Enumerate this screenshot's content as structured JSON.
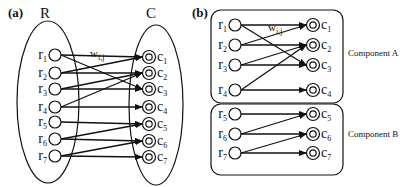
{
  "panels": [
    {
      "id": "a",
      "label": "(a)",
      "set_labels": {
        "left": "R",
        "right": "C"
      },
      "edge_weight_label": {
        "main": "w",
        "sub": "i,j"
      },
      "sources": [
        {
          "name": "r",
          "index": "1"
        },
        {
          "name": "r",
          "index": "2"
        },
        {
          "name": "r",
          "index": "3"
        },
        {
          "name": "r",
          "index": "4"
        },
        {
          "name": "r",
          "index": "5"
        },
        {
          "name": "r",
          "index": "6"
        },
        {
          "name": "r",
          "index": "7"
        }
      ],
      "targets": [
        {
          "name": "c",
          "index": "1"
        },
        {
          "name": "c",
          "index": "2"
        },
        {
          "name": "c",
          "index": "3"
        },
        {
          "name": "c",
          "index": "4"
        },
        {
          "name": "c",
          "index": "5"
        },
        {
          "name": "c",
          "index": "6"
        },
        {
          "name": "c",
          "index": "7"
        }
      ],
      "edges": [
        [
          1,
          1
        ],
        [
          1,
          3
        ],
        [
          2,
          1
        ],
        [
          2,
          2
        ],
        [
          3,
          2
        ],
        [
          3,
          3
        ],
        [
          4,
          2
        ],
        [
          4,
          4
        ],
        [
          5,
          5
        ],
        [
          6,
          5
        ],
        [
          6,
          6
        ],
        [
          7,
          6
        ],
        [
          7,
          7
        ]
      ]
    },
    {
      "id": "b",
      "label": "(b)",
      "edge_weight_label": {
        "main": "w",
        "sub": "i,j"
      },
      "components": [
        {
          "label": "Component A",
          "sources": [
            {
              "name": "r",
              "index": "1"
            },
            {
              "name": "r",
              "index": "2"
            },
            {
              "name": "r",
              "index": "3"
            },
            {
              "name": "r",
              "index": "4"
            }
          ],
          "targets": [
            {
              "name": "c",
              "index": "1"
            },
            {
              "name": "c",
              "index": "2"
            },
            {
              "name": "c",
              "index": "3"
            },
            {
              "name": "c",
              "index": "4"
            }
          ],
          "edges": [
            [
              1,
              1
            ],
            [
              1,
              3
            ],
            [
              2,
              1
            ],
            [
              2,
              2
            ],
            [
              3,
              2
            ],
            [
              3,
              3
            ],
            [
              4,
              2
            ],
            [
              4,
              4
            ]
          ]
        },
        {
          "label": "Component B",
          "sources": [
            {
              "name": "r",
              "index": "5"
            },
            {
              "name": "r",
              "index": "6"
            },
            {
              "name": "r",
              "index": "7"
            }
          ],
          "targets": [
            {
              "name": "c",
              "index": "5"
            },
            {
              "name": "c",
              "index": "6"
            },
            {
              "name": "c",
              "index": "7"
            }
          ],
          "edges": [
            [
              5,
              5
            ],
            [
              6,
              5
            ],
            [
              6,
              6
            ],
            [
              7,
              6
            ],
            [
              7,
              7
            ]
          ]
        }
      ]
    }
  ]
}
